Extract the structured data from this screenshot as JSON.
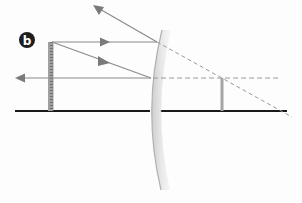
{
  "figure": {
    "panel_label": "b",
    "colors": {
      "background": "#fdfdfd",
      "axis": "#1a1a1a",
      "ray": "#8a8a8a",
      "arrowhead": "#7a7a7a",
      "dashed": "#9a9a9a",
      "object": "#9a9a9a",
      "image": "#a5a5a5",
      "mirror": "#b8b8b8",
      "badge_fill": "#1e1e1e",
      "badge_text": "#ffffff"
    },
    "elements": {
      "principal_axis": "principal axis",
      "mirror": "convex mirror",
      "object": "object (ruler)",
      "image": "virtual image",
      "incident_ray_parallel": "incident ray parallel to axis",
      "reflected_ray_parallel": "reflected ray diverging",
      "incident_ray_focal": "incident ray toward focal point",
      "reflected_ray_focal": "reflected ray parallel to axis",
      "virtual_extension_1": "virtual extension through focus",
      "virtual_extension_2": "virtual extension parallel to axis"
    }
  }
}
